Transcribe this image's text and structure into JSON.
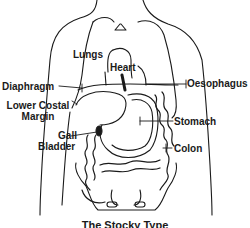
{
  "diagram": {
    "type": "anatomical-illustration",
    "caption": "The Stocky Type",
    "line_color": "#1a1a1a",
    "background": "#ffffff",
    "labels": {
      "lungs": "Lungs",
      "heart": "Heart",
      "diaphragm": "Diaphragm",
      "oesophagus": "Oesophagus",
      "lower_costal_margin_line1": "Lower Costal",
      "lower_costal_margin_line2": "Margin",
      "gall_bladder_line1": "Gall",
      "gall_bladder_line2": "Bladder",
      "stomach": "Stomach",
      "colon": "Colon"
    }
  }
}
